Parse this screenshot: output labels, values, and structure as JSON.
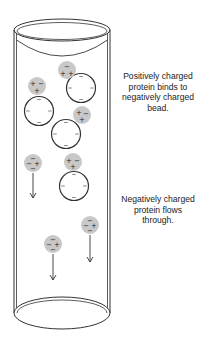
{
  "labels": {
    "top_lines": [
      "Positively charged",
      "protein binds to",
      "negatively charged",
      "bead."
    ],
    "bottom_lines": [
      "Negatively charged",
      "protein flows",
      "through."
    ]
  },
  "colors": {
    "stroke": "#333333",
    "protein_fill": "#c8c8c8",
    "text": "#222222"
  },
  "column": {
    "cx": 62,
    "rx": 48,
    "top_cy": 30,
    "top_ry": 11,
    "bottom_cy": 313,
    "bottom_ry": 16
  },
  "beads": [
    {
      "cx": 81,
      "cy": 88,
      "r": 14.5
    },
    {
      "cx": 39,
      "cy": 111,
      "r": 14.5
    },
    {
      "cx": 66,
      "cy": 134,
      "r": 14.5
    },
    {
      "cx": 74,
      "cy": 186,
      "r": 14.5
    }
  ],
  "positive_proteins": [
    {
      "cx": 67,
      "cy": 70,
      "charges": [
        {
          "s": "−",
          "dx": 0,
          "dy": -4
        },
        {
          "s": "+",
          "dx": -4,
          "dy": 3
        },
        {
          "s": "+",
          "dx": 4,
          "dy": 3
        }
      ]
    },
    {
      "cx": 37,
      "cy": 86,
      "charges": [
        {
          "s": "+",
          "dx": -4,
          "dy": -3
        },
        {
          "s": "−",
          "dx": 4,
          "dy": -3
        },
        {
          "s": "+",
          "dx": 0,
          "dy": 4
        }
      ]
    },
    {
      "cx": 82,
      "cy": 115,
      "charges": [
        {
          "s": "+",
          "dx": -3,
          "dy": -3
        },
        {
          "s": "−",
          "dx": 4,
          "dy": -2
        },
        {
          "s": "+",
          "dx": 0,
          "dy": 4
        }
      ]
    },
    {
      "cx": 73,
      "cy": 162,
      "charges": [
        {
          "s": "+",
          "dx": -4,
          "dy": -2
        },
        {
          "s": "−",
          "dx": 4,
          "dy": -2
        },
        {
          "s": "+",
          "dx": 0,
          "dy": 4
        }
      ]
    }
  ],
  "negative_proteins": [
    {
      "cx": 33,
      "cy": 163,
      "arrow_y1": 173,
      "arrow_y2": 198,
      "charges": [
        {
          "s": "−",
          "dx": 0,
          "dy": -5
        },
        {
          "s": "−",
          "dx": -4,
          "dy": 0
        },
        {
          "s": "+",
          "dx": 4,
          "dy": 0
        },
        {
          "s": "−",
          "dx": 0,
          "dy": 5
        }
      ]
    },
    {
      "cx": 90,
      "cy": 225,
      "arrow_y1": 235,
      "arrow_y2": 262,
      "charges": [
        {
          "s": "−",
          "dx": 0,
          "dy": -5
        },
        {
          "s": "−",
          "dx": -4,
          "dy": 0
        },
        {
          "s": "+",
          "dx": 4,
          "dy": 0
        },
        {
          "s": "−",
          "dx": 0,
          "dy": 5
        }
      ]
    },
    {
      "cx": 53,
      "cy": 244,
      "arrow_y1": 254,
      "arrow_y2": 280,
      "charges": [
        {
          "s": "−",
          "dx": 0,
          "dy": -5
        },
        {
          "s": "−",
          "dx": -4,
          "dy": 0
        },
        {
          "s": "+",
          "dx": 4,
          "dy": 0
        },
        {
          "s": "−",
          "dx": 0,
          "dy": 5
        }
      ]
    }
  ]
}
